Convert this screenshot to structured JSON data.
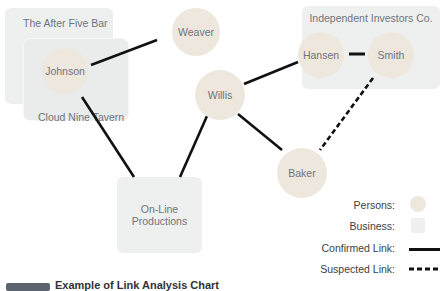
{
  "diagram": {
    "type": "link-analysis",
    "businesses": [
      {
        "id": "after-five",
        "label": "The After Five Bar"
      },
      {
        "id": "cloud-nine",
        "label": "Cloud Nine Tavern"
      },
      {
        "id": "independent",
        "label": "Independent Investors Co."
      },
      {
        "id": "online",
        "label_line1": "On-Line",
        "label_line2": "Productions"
      }
    ],
    "persons": [
      {
        "id": "johnson",
        "label": "Johnson"
      },
      {
        "id": "weaver",
        "label": "Weaver"
      },
      {
        "id": "willis",
        "label": "Willis"
      },
      {
        "id": "hansen",
        "label": "Hansen"
      },
      {
        "id": "smith",
        "label": "Smith"
      },
      {
        "id": "baker",
        "label": "Baker"
      }
    ],
    "links": [
      {
        "from": "johnson",
        "to": "weaver",
        "type": "confirmed"
      },
      {
        "from": "johnson",
        "to": "online",
        "type": "confirmed"
      },
      {
        "from": "willis",
        "to": "online",
        "type": "confirmed"
      },
      {
        "from": "willis",
        "to": "hansen",
        "type": "confirmed"
      },
      {
        "from": "willis",
        "to": "baker",
        "type": "confirmed"
      },
      {
        "from": "hansen",
        "to": "smith",
        "type": "confirmed"
      },
      {
        "from": "smith",
        "to": "baker",
        "type": "suspected"
      }
    ]
  },
  "legend": {
    "persons": "Persons:",
    "business": "Business:",
    "confirmed": "Confirmed Link:",
    "suspected": "Suspected Link:"
  },
  "colors": {
    "person_fill": "#ede7de",
    "business_fill": "#eef0ef",
    "link": "#111111"
  },
  "caption": "Example of Link Analysis Chart"
}
